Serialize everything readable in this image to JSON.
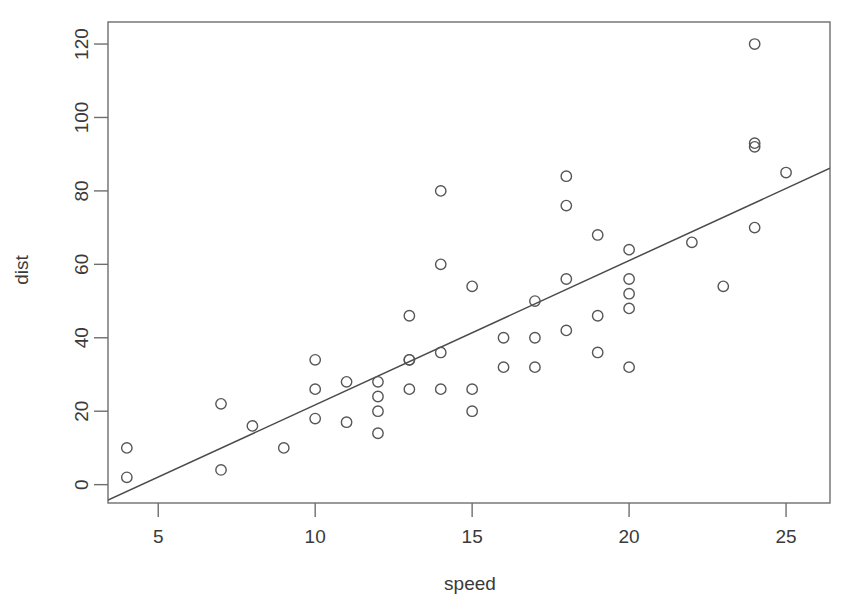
{
  "chart_data": {
    "type": "scatter",
    "title": "",
    "xlabel": "speed",
    "ylabel": "dist",
    "xlim": [
      3.4,
      26.4
    ],
    "ylim": [
      -5.0,
      126.0
    ],
    "grid": false,
    "legend": null,
    "x_ticks": [
      5,
      10,
      15,
      20,
      25
    ],
    "y_ticks": [
      0,
      20,
      40,
      60,
      80,
      100,
      120
    ],
    "x_tick_labels": [
      "5",
      "10",
      "15",
      "20",
      "25"
    ],
    "y_tick_labels": [
      "0",
      "20",
      "40",
      "60",
      "80",
      "100",
      "120"
    ],
    "point_marker": "open-circle",
    "point_color": "#565656",
    "line_color": "#4a4a4a",
    "series": [
      {
        "name": "cars",
        "x": [
          4,
          4,
          7,
          7,
          8,
          9,
          10,
          10,
          10,
          11,
          11,
          12,
          12,
          12,
          12,
          13,
          13,
          13,
          13,
          14,
          14,
          14,
          14,
          15,
          15,
          15,
          16,
          16,
          17,
          17,
          17,
          18,
          18,
          18,
          18,
          19,
          19,
          19,
          20,
          20,
          20,
          20,
          20,
          22,
          23,
          24,
          24,
          24,
          24,
          25
        ],
        "y": [
          2,
          10,
          4,
          22,
          16,
          10,
          18,
          26,
          34,
          17,
          28,
          14,
          20,
          24,
          28,
          26,
          34,
          34,
          46,
          26,
          36,
          60,
          80,
          20,
          26,
          54,
          32,
          40,
          32,
          40,
          50,
          42,
          56,
          76,
          84,
          36,
          46,
          68,
          32,
          48,
          52,
          56,
          64,
          66,
          54,
          70,
          92,
          93,
          120,
          85
        ]
      }
    ],
    "fit_line": {
      "name": "least-squares regression",
      "intercept": -17.58,
      "slope": 3.93,
      "x_start": 3.4,
      "x_end": 26.4
    }
  },
  "labels": {
    "x_axis_title": "speed",
    "y_axis_title": "dist"
  }
}
